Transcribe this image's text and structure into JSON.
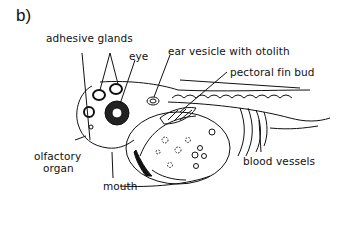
{
  "figure": {
    "panel_label": "b)",
    "labels": {
      "adhesive_glands": "adhesive glands",
      "eye": "eye",
      "ear_vesicle": "ear vesicle with otolith",
      "pectoral_fin_bud": "pectoral fin bud",
      "olfactory_line1": "olfactory",
      "olfactory_line2": "organ",
      "mouth": "mouth",
      "blood_vessels": "blood vessels"
    },
    "colors": {
      "line": "#111111",
      "background": "#ffffff"
    }
  }
}
